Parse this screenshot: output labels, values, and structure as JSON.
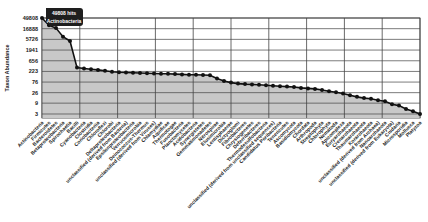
{
  "chart_data": {
    "type": "area",
    "title": "",
    "xlabel": "",
    "ylabel": "Taxon Abundance",
    "yscale": "log",
    "yticks": [
      3,
      9,
      26,
      76,
      223,
      656,
      1941,
      5726,
      16888,
      49808
    ],
    "ylim": [
      2,
      49808
    ],
    "grid": true,
    "legend": "none",
    "tooltip": {
      "value_text": "49808 hits",
      "label_text": "Actinobacteria"
    },
    "categories": [
      "Actinobacteria",
      "Firmicutes",
      "Bacteroidetes",
      "Betaproteobacteria",
      "Spirochaetia",
      "Bacilli",
      "Cyanobacteria",
      "Clostridia",
      "Coriobacteriia",
      "Chloroflexi",
      "Chlorobi",
      "Deltaproteobacteria",
      "unclassified (derived from Bacteria)",
      "Epsilonproteobacteria",
      "Verrucomicrobia",
      "Deinococcus-Thermus",
      "unclassified (derived from Viruses)",
      "Chlamydiae",
      "Aquificae",
      "Thermotogae",
      "Fusobacteria",
      "Planctomycetes",
      "Acidobacteria",
      "Synergistetes",
      "Gemmatimonadetes",
      "Nitrospirae",
      "Elusimicrobia",
      "Lentisphaerae",
      "Dictyoglomi",
      "Fibrobacteres",
      "Chrysiogenetes",
      "Deferribacteres",
      "Thermodesulfobacteria",
      "unclassified (derived from unclassified sequences)",
      "Candidatus Poribacteria",
      "Tenericutes",
      "Ascomycota",
      "Basidiomycota",
      "Chordata",
      "Arthropoda",
      "Streptophyta",
      "Chlorophyta",
      "Nematoda",
      "Apicomplexa",
      "Euryarchaeota",
      "Crenarchaeota",
      "Thaumarchaeota",
      "Korarchaeota",
      "unclassified (derived from Archaea)",
      "Nanoarchaeota",
      "unclassified (derived from Eukaryota)",
      "Cnidaria",
      "Microsporidia",
      "Mollusca",
      "Platyzoa"
    ],
    "values": [
      49808,
      24000,
      18000,
      7500,
      4800,
      330,
      300,
      280,
      260,
      240,
      215,
      205,
      200,
      195,
      190,
      185,
      180,
      178,
      175,
      170,
      165,
      160,
      158,
      155,
      150,
      110,
      85,
      72,
      65,
      62,
      60,
      58,
      55,
      52,
      50,
      48,
      46,
      42,
      40,
      38,
      34,
      30,
      27,
      24,
      20,
      17,
      15,
      14,
      12,
      11,
      8,
      7,
      5,
      4,
      3
    ]
  }
}
